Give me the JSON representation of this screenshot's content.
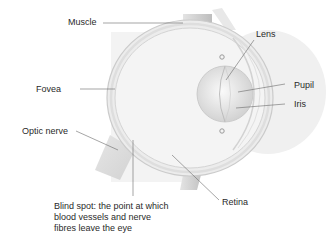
{
  "diagram": {
    "labels": {
      "muscle": "Muscle",
      "fovea": "Fovea",
      "optic_nerve": "Optic nerve",
      "lens": "Lens",
      "pupil": "Pupil",
      "iris": "Iris",
      "retina": "Retina",
      "blind_spot": "Blind spot: the point at which blood vessels and nerve fibres leave the eye"
    },
    "colors": {
      "background": "#ffffff",
      "eyeball_fill": "#eeeeee",
      "eyeball_outline": "#c8c8c8",
      "cornea_bulge": "#f1f1f1",
      "lens_fill": "#d9d9d9",
      "muscle_fill": "#cfcfcf",
      "leader_line": "#6a6a6a",
      "text": "#2a2a2a"
    }
  }
}
